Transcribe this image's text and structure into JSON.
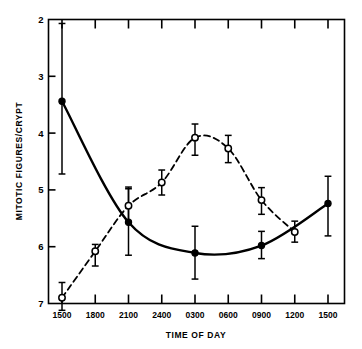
{
  "chart_data": {
    "type": "line",
    "title": "",
    "xlabel": "TIME OF DAY",
    "ylabel": "MITOTIC FIGURES/CRYPT",
    "categories": [
      "1500",
      "1800",
      "2100",
      "2400",
      "0300",
      "0600",
      "0900",
      "1200",
      "1500"
    ],
    "xtick_labels": [
      "1500",
      "1800",
      "2100",
      "2400",
      "0300",
      "0600",
      "0900",
      "1200",
      "1500"
    ],
    "ytick_labels": [
      "7",
      "6",
      "5",
      "4",
      "3",
      "2"
    ],
    "ylim": [
      2,
      7
    ],
    "yticks": [
      2,
      3,
      4,
      5,
      6,
      7
    ],
    "grid": false,
    "legend_position": "none",
    "series": [
      {
        "name": "solid-filled-circle-series",
        "marker": "filled-circle",
        "line_style": "solid",
        "color": "#000000",
        "x": [
          "1500",
          "2100",
          "0300",
          "0900",
          "1500"
        ],
        "values": [
          5.56,
          3.43,
          2.89,
          3.02,
          3.76
        ],
        "err_low": [
          4.28,
          2.85,
          2.43,
          2.79,
          3.19
        ],
        "err_high": [
          6.93,
          4.05,
          3.36,
          3.27,
          4.24
        ]
      },
      {
        "name": "dashed-open-circle-series",
        "marker": "open-circle",
        "line_style": "dashed",
        "color": "#000000",
        "x": [
          "1500",
          "1800",
          "2100",
          "2400",
          "0300",
          "0600",
          "0900",
          "1200"
        ],
        "values": [
          2.1,
          2.92,
          3.72,
          4.13,
          4.92,
          4.73,
          3.82,
          3.26
        ],
        "err_low": [
          1.88,
          2.66,
          3.43,
          3.91,
          4.61,
          4.48,
          3.57,
          3.08
        ],
        "err_high": [
          2.37,
          3.04,
          4.02,
          4.35,
          5.16,
          4.96,
          4.04,
          3.45
        ]
      }
    ]
  },
  "axes": {
    "y_axis_title": "MITOTIC FIGURES/CRYPT",
    "x_axis_title": "TIME OF DAY"
  }
}
